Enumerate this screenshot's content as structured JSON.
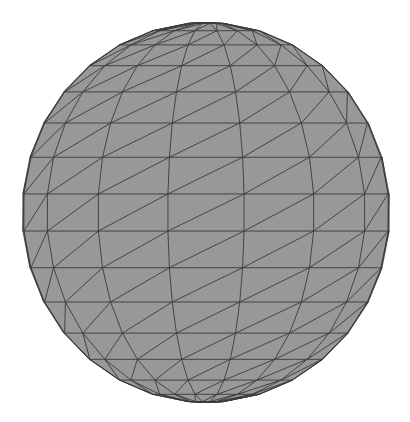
{
  "scene": {
    "object": "wireframe-sphere",
    "background_color": "#ffffff",
    "fill_color": "#989898",
    "edge_color": "#3a3a3a",
    "center": [
      206,
      212.5
    ],
    "radius_x": 184,
    "radius_y": 190,
    "latitude_rings_deg": [
      -90,
      -84.4,
      -73.1,
      -61.9,
      -50.6,
      -39.4,
      -28.1,
      -16.9,
      -5.6,
      5.6,
      16.9,
      28.1,
      39.4,
      50.6,
      61.9,
      73.1,
      84.4,
      90
    ],
    "visible_meridians_deg": [
      -90,
      -84,
      -60,
      -36,
      -12,
      12,
      36,
      60,
      84,
      90
    ],
    "diagonal_direction": "lower-left-to-upper-right"
  }
}
